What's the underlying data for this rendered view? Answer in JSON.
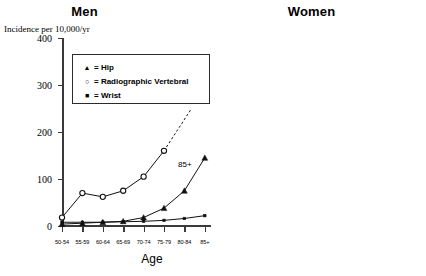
{
  "axis_label_y": "Incidence per 10,000/yr",
  "axis_label_x": "Age",
  "legend": {
    "items": [
      {
        "marker": "triangle",
        "glyph": "▲",
        "text": "= Hip"
      },
      {
        "marker": "open-circle",
        "glyph": "○",
        "text": "= Radiographic Vertebral"
      },
      {
        "marker": "square",
        "glyph": "■",
        "text": "= Wrist"
      }
    ]
  },
  "panels": [
    {
      "id": "men",
      "title": "Men"
    },
    {
      "id": "women",
      "title": "Women"
    }
  ],
  "annotations": {
    "men_85plus": "85+"
  },
  "yticks": [
    "0",
    "100",
    "200",
    "300",
    "400"
  ],
  "xticks": [
    "50-54",
    "55-59",
    "60-64",
    "65-69",
    "70-74",
    "75-79",
    "80-84",
    "85+"
  ],
  "chart_data": [
    {
      "type": "line",
      "title": "Men",
      "xlabel": "Age",
      "ylabel": "Incidence per 10,000/yr",
      "ylim": [
        0,
        400
      ],
      "yticks": [
        0,
        100,
        200,
        300,
        400
      ],
      "grid": false,
      "legend_position": "inside-upper-left",
      "categories": [
        "50-54",
        "55-59",
        "60-64",
        "65-69",
        "70-74",
        "75-79",
        "80-84",
        "85+"
      ],
      "series": [
        {
          "name": "Hip",
          "marker": "triangle",
          "values": [
            4,
            6,
            8,
            10,
            18,
            38,
            75,
            145
          ]
        },
        {
          "name": "Radiographic Vertebral",
          "marker": "open-circle",
          "values": [
            18,
            70,
            62,
            75,
            105,
            160,
            null,
            null
          ],
          "projection": {
            "style": "dashed",
            "from": [
              5,
              160
            ],
            "to": [
              6.35,
              250
            ]
          }
        },
        {
          "name": "Wrist",
          "marker": "square",
          "values": [
            8,
            8,
            8,
            9,
            10,
            12,
            16,
            22
          ]
        }
      ],
      "annotations": [
        {
          "text": "85+",
          "near": "Hip 85+ point"
        }
      ]
    },
    {
      "type": "line",
      "title": "Women",
      "xlabel": "Age",
      "ylabel": "Incidence per 10,000/yr",
      "ylim": [
        0,
        400
      ],
      "yticks": [
        0,
        100,
        200,
        300,
        400
      ],
      "grid": false,
      "legend_position": "none",
      "categories": [
        "50-54",
        "55-59",
        "60-64",
        "65-69",
        "70-74",
        "75-79",
        "80-84",
        "85+"
      ],
      "series": [
        {
          "name": "Hip",
          "marker": "triangle",
          "values": [
            8,
            8,
            14,
            22,
            42,
            95,
            215,
            365
          ]
        },
        {
          "name": "Radiographic Vertebral",
          "marker": "open-circle",
          "values": [
            42,
            75,
            125,
            165,
            225,
            310,
            null,
            null
          ],
          "projection": {
            "style": "dashed",
            "from": [
              5,
              310
            ],
            "to": [
              5.95,
              400
            ]
          }
        },
        {
          "name": "Wrist",
          "marker": "square",
          "values": [
            25,
            24,
            44,
            50,
            55,
            120,
            105,
            130
          ]
        }
      ]
    }
  ]
}
